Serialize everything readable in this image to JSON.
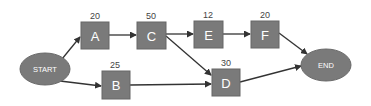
{
  "diagram": {
    "type": "activity-network",
    "colors": {
      "node_fill": "#7a7a7a",
      "node_stroke": "#666666",
      "edge": "#333333",
      "text": "#ffffff",
      "label": "#444444"
    },
    "start": {
      "label": "START"
    },
    "end": {
      "label": "END"
    },
    "activities": [
      {
        "id": "A",
        "label": "A",
        "duration": "20"
      },
      {
        "id": "C",
        "label": "C",
        "duration": "50"
      },
      {
        "id": "E",
        "label": "E",
        "duration": "12"
      },
      {
        "id": "F",
        "label": "F",
        "duration": "20"
      },
      {
        "id": "B",
        "label": "B",
        "duration": "25"
      },
      {
        "id": "D",
        "label": "D",
        "duration": "30"
      }
    ],
    "edges": [
      [
        "START",
        "A"
      ],
      [
        "START",
        "B"
      ],
      [
        "A",
        "C"
      ],
      [
        "C",
        "E"
      ],
      [
        "C",
        "D"
      ],
      [
        "E",
        "F"
      ],
      [
        "B",
        "D"
      ],
      [
        "F",
        "END"
      ],
      [
        "D",
        "END"
      ]
    ]
  }
}
